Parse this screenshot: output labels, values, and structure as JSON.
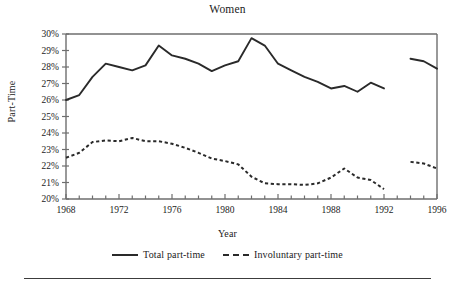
{
  "figure": {
    "title": "Women",
    "footer_rule": true
  },
  "axes": {
    "ylabel": "Part-Time",
    "xlabel": "Year",
    "ytick_labels": [
      "20%",
      "21%",
      "22%",
      "23%",
      "24%",
      "25%",
      "26%",
      "27%",
      "28%",
      "29%",
      "30%"
    ],
    "xtick_labels": [
      "1968",
      "1972",
      "1976",
      "1980",
      "1984",
      "1988",
      "1992",
      "1996"
    ]
  },
  "legend": {
    "items": [
      {
        "label": "Total part-time",
        "style": "solid",
        "color": "#2a2a2a"
      },
      {
        "label": "Involuntary part-time",
        "style": "dashed",
        "color": "#2a2a2a"
      }
    ]
  },
  "colors": {
    "line": "#2a2a2a",
    "axis": "#6e6e6e",
    "text": "#1b1b1b"
  },
  "chart_data": {
    "type": "line",
    "title": "Women",
    "xlabel": "Year",
    "ylabel": "Part-Time",
    "xlim": [
      1968,
      1996
    ],
    "ylim": [
      20,
      30
    ],
    "ytick_step": 1,
    "xtick_step_minor": 1,
    "xtick_step_major": 4,
    "grid": false,
    "legend_position": "bottom",
    "units": "percent",
    "note": "Series break between 1992 and 1994 (no data plotted for 1993)",
    "series": [
      {
        "name": "Total part-time",
        "style": "solid",
        "segments": [
          {
            "x": [
              1968,
              1969,
              1970,
              1971,
              1972,
              1973,
              1974,
              1975,
              1976,
              1977,
              1978,
              1979,
              1980,
              1981,
              1982,
              1983,
              1984,
              1985,
              1986,
              1987,
              1988,
              1989,
              1990,
              1991,
              1992
            ],
            "y": [
              26.0,
              26.3,
              27.4,
              28.2,
              28.0,
              27.8,
              28.1,
              29.3,
              28.7,
              28.5,
              28.2,
              27.75,
              28.1,
              28.35,
              29.75,
              29.3,
              28.2,
              27.8,
              27.4,
              27.1,
              26.7,
              26.85,
              26.5,
              27.05,
              26.7
            ]
          },
          {
            "x": [
              1994,
              1995,
              1996
            ],
            "y": [
              28.5,
              28.35,
              27.9
            ]
          }
        ]
      },
      {
        "name": "Involuntary part-time",
        "style": "dashed",
        "segments": [
          {
            "x": [
              1968,
              1969,
              1970,
              1971,
              1972,
              1973,
              1974,
              1975,
              1976,
              1977,
              1978,
              1979,
              1980,
              1981,
              1982,
              1983,
              1984,
              1985,
              1986,
              1987,
              1988,
              1989,
              1990,
              1991,
              1992
            ],
            "y": [
              22.5,
              22.8,
              23.45,
              23.55,
              23.5,
              23.7,
              23.5,
              23.5,
              23.35,
              23.1,
              22.8,
              22.45,
              22.3,
              22.1,
              21.35,
              20.95,
              20.9,
              20.9,
              20.85,
              20.95,
              21.3,
              21.85,
              21.3,
              21.15,
              20.6
            ]
          },
          {
            "x": [
              1994,
              1995,
              1996
            ],
            "y": [
              22.25,
              22.15,
              21.85
            ]
          }
        ]
      }
    ]
  }
}
